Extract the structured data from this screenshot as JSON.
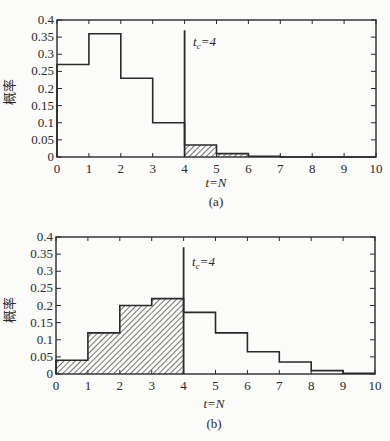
{
  "figure": {
    "panels": [
      {
        "id": "a",
        "caption": "(a)",
        "xlabel": "t=N",
        "ylabel": "概率",
        "marker_label": "t_c=4",
        "marker_label_main": "t",
        "marker_label_sub": "c",
        "marker_label_rest": "=4"
      },
      {
        "id": "b",
        "caption": "(b)",
        "xlabel": "t=N",
        "ylabel": "概率",
        "marker_label": "t_c=4",
        "marker_label_main": "t",
        "marker_label_sub": "c",
        "marker_label_rest": "=4"
      }
    ]
  },
  "chart_data": [
    {
      "type": "bar",
      "subtype": "step-histogram",
      "title": "(a)",
      "xlabel": "t=N",
      "ylabel": "概率",
      "xlim": [
        0,
        10
      ],
      "ylim": [
        0,
        0.4
      ],
      "xticks": [
        0,
        1,
        2,
        3,
        4,
        5,
        6,
        7,
        8,
        9,
        10
      ],
      "yticks": [
        0,
        0.05,
        0.1,
        0.15,
        0.2,
        0.25,
        0.3,
        0.35,
        0.4
      ],
      "ytick_labels": [
        "0",
        "0.05",
        "0.1",
        "0.15",
        "0.2",
        "0.25",
        "0.3",
        "0.35",
        "0.4"
      ],
      "bins": [
        [
          0,
          1
        ],
        [
          1,
          2
        ],
        [
          2,
          3
        ],
        [
          3,
          4
        ],
        [
          4,
          5
        ],
        [
          5,
          6
        ],
        [
          6,
          7
        ],
        [
          7,
          8
        ],
        [
          8,
          9
        ],
        [
          9,
          10
        ]
      ],
      "values": [
        0.27,
        0.36,
        0.23,
        0.1,
        0.035,
        0.01,
        0.002,
        0,
        0,
        0
      ],
      "hatched_range": [
        4,
        10
      ],
      "vertical_marker": {
        "x": 4,
        "label": "t_c=4",
        "top": 0.37
      },
      "grid": false,
      "legend": null
    },
    {
      "type": "bar",
      "subtype": "step-histogram",
      "title": "(b)",
      "xlabel": "t=N",
      "ylabel": "概率",
      "xlim": [
        0,
        10
      ],
      "ylim": [
        0,
        0.4
      ],
      "xticks": [
        0,
        1,
        2,
        3,
        4,
        5,
        6,
        7,
        8,
        9,
        10
      ],
      "yticks": [
        0,
        0.05,
        0.1,
        0.15,
        0.2,
        0.25,
        0.3,
        0.35,
        0.4
      ],
      "ytick_labels": [
        "0",
        "0.05",
        "0.1",
        "0.15",
        "0.2",
        "0.25",
        "0.3",
        "0.35",
        "0.4"
      ],
      "bins": [
        [
          0,
          1
        ],
        [
          1,
          2
        ],
        [
          2,
          3
        ],
        [
          3,
          4
        ],
        [
          4,
          5
        ],
        [
          5,
          6
        ],
        [
          6,
          7
        ],
        [
          7,
          8
        ],
        [
          8,
          9
        ],
        [
          9,
          10
        ]
      ],
      "values": [
        0.04,
        0.12,
        0.2,
        0.22,
        0.18,
        0.12,
        0.065,
        0.035,
        0.01,
        0.002
      ],
      "hatched_range": [
        0,
        4
      ],
      "vertical_marker": {
        "x": 4,
        "label": "t_c=4",
        "top": 0.37
      },
      "grid": false,
      "legend": null
    }
  ]
}
